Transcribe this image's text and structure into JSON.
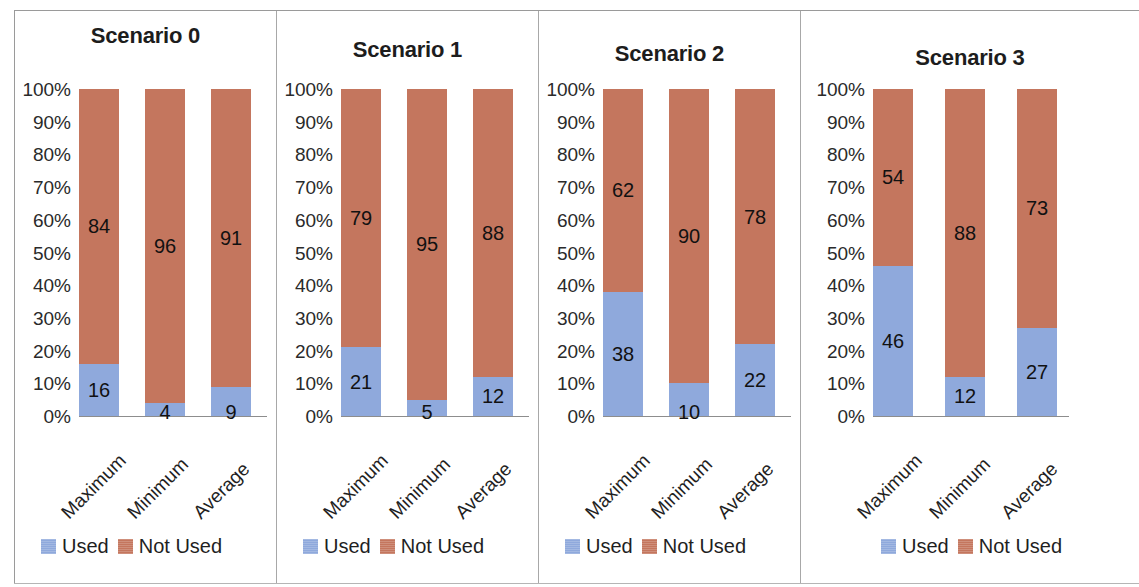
{
  "colors": {
    "used": "#8fa9dc",
    "not_used": "#c4765e",
    "axis": "#8d8d8d",
    "text": "#1f1f1f",
    "panel_divider": "#a8a8a8"
  },
  "legend": {
    "items": [
      {
        "label": "Used",
        "key": "used"
      },
      {
        "label": "Not Used",
        "key": "not_used"
      }
    ]
  },
  "axis": {
    "ticks": [
      "100%",
      "90%",
      "80%",
      "70%",
      "60%",
      "50%",
      "40%",
      "30%",
      "20%",
      "10%",
      "0%"
    ],
    "categories": [
      "Maximum",
      "Minimum",
      "Average"
    ]
  },
  "chart_data": [
    {
      "type": "bar",
      "title": "Scenario 0",
      "stacked": true,
      "percent_stacked": true,
      "categories": [
        "Maximum",
        "Minimum",
        "Average"
      ],
      "series": [
        {
          "name": "Used",
          "values": [
            16,
            4,
            9
          ]
        },
        {
          "name": "Not Used",
          "values": [
            84,
            96,
            91
          ]
        }
      ],
      "xlabel": "",
      "ylabel": "",
      "ylim": [
        0,
        100
      ],
      "yticks": [
        0,
        10,
        20,
        30,
        40,
        50,
        60,
        70,
        80,
        90,
        100
      ],
      "grid": false,
      "legend_position": "bottom"
    },
    {
      "type": "bar",
      "title": "Scenario 1",
      "stacked": true,
      "percent_stacked": true,
      "categories": [
        "Maximum",
        "Minimum",
        "Average"
      ],
      "series": [
        {
          "name": "Used",
          "values": [
            21,
            5,
            12
          ]
        },
        {
          "name": "Not Used",
          "values": [
            79,
            95,
            88
          ]
        }
      ],
      "xlabel": "",
      "ylabel": "",
      "ylim": [
        0,
        100
      ],
      "yticks": [
        0,
        10,
        20,
        30,
        40,
        50,
        60,
        70,
        80,
        90,
        100
      ],
      "grid": false,
      "legend_position": "bottom"
    },
    {
      "type": "bar",
      "title": "Scenario 2",
      "stacked": true,
      "percent_stacked": true,
      "categories": [
        "Maximum",
        "Minimum",
        "Average"
      ],
      "series": [
        {
          "name": "Used",
          "values": [
            38,
            10,
            22
          ]
        },
        {
          "name": "Not Used",
          "values": [
            62,
            90,
            78
          ]
        }
      ],
      "xlabel": "",
      "ylabel": "",
      "ylim": [
        0,
        100
      ],
      "yticks": [
        0,
        10,
        20,
        30,
        40,
        50,
        60,
        70,
        80,
        90,
        100
      ],
      "grid": false,
      "legend_position": "bottom"
    },
    {
      "type": "bar",
      "title": "Scenario 3",
      "stacked": true,
      "percent_stacked": true,
      "categories": [
        "Maximum",
        "Minimum",
        "Average"
      ],
      "series": [
        {
          "name": "Used",
          "values": [
            46,
            12,
            27
          ]
        },
        {
          "name": "Not Used",
          "values": [
            54,
            88,
            73
          ]
        }
      ],
      "xlabel": "",
      "ylabel": "",
      "ylim": [
        0,
        100
      ],
      "yticks": [
        0,
        10,
        20,
        30,
        40,
        50,
        60,
        70,
        80,
        90,
        100
      ],
      "grid": false,
      "legend_position": "bottom"
    }
  ]
}
